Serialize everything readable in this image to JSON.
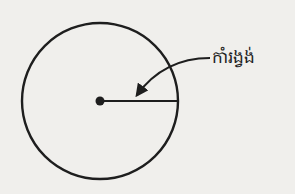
{
  "diagram": {
    "label": "កាំរង្វង់",
    "colors": {
      "background": "#f0efec",
      "stroke": "#1e1e1e"
    }
  }
}
